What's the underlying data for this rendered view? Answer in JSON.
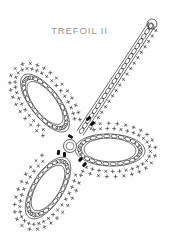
{
  "page": {
    "background_color": "#fefefe",
    "width": 169,
    "height": 250
  },
  "title": {
    "text": "TREFOIL II",
    "color": "#9a9a9a"
  },
  "diagram": {
    "name": "trefoil-crochet-chart",
    "stroke_color": "#2b2b2b",
    "accent_color": "#111111",
    "center": {
      "x": 70,
      "y": 146,
      "r": 6.5
    },
    "petals": [
      {
        "name": "upper-left-petal",
        "cx": 45,
        "cy": 103,
        "rx": 14.5,
        "ry": 35,
        "rotation": -38,
        "chain_links": 26,
        "halo_marks": 34
      },
      {
        "name": "lower-left-petal",
        "cx": 48,
        "cy": 188,
        "rx": 15.5,
        "ry": 35,
        "rotation": 32,
        "chain_links": 26,
        "halo_marks": 34
      },
      {
        "name": "right-petal",
        "cx": 110,
        "cy": 150,
        "rx": 35,
        "ry": 16,
        "rotation": 2,
        "chain_links": 26,
        "halo_marks": 34
      }
    ],
    "stem": {
      "name": "chain-stem",
      "start": {
        "x": 80,
        "y": 133
      },
      "end": {
        "x": 152,
        "y": 24
      },
      "width": 7.5,
      "chain_links": 22,
      "edge_marks": 20,
      "tip_loop_r": 5
    },
    "markers": [
      {
        "name": "start-marker",
        "x": 70.5,
        "y": 136.5,
        "angle": -60
      },
      {
        "name": "join-marker-a",
        "x": 58.5,
        "y": 152.5,
        "angle": 10
      },
      {
        "name": "join-marker-b",
        "x": 64.5,
        "y": 154.5,
        "angle": 0
      },
      {
        "name": "join-marker-c",
        "x": 80.5,
        "y": 159.5,
        "angle": 40
      },
      {
        "name": "join-marker-d",
        "x": 84.5,
        "y": 164.5,
        "angle": 40
      },
      {
        "name": "stem-marker-a",
        "x": 88.5,
        "y": 118.5,
        "angle": 50
      },
      {
        "name": "stem-marker-b",
        "x": 92.5,
        "y": 123.5,
        "angle": 50
      }
    ]
  }
}
